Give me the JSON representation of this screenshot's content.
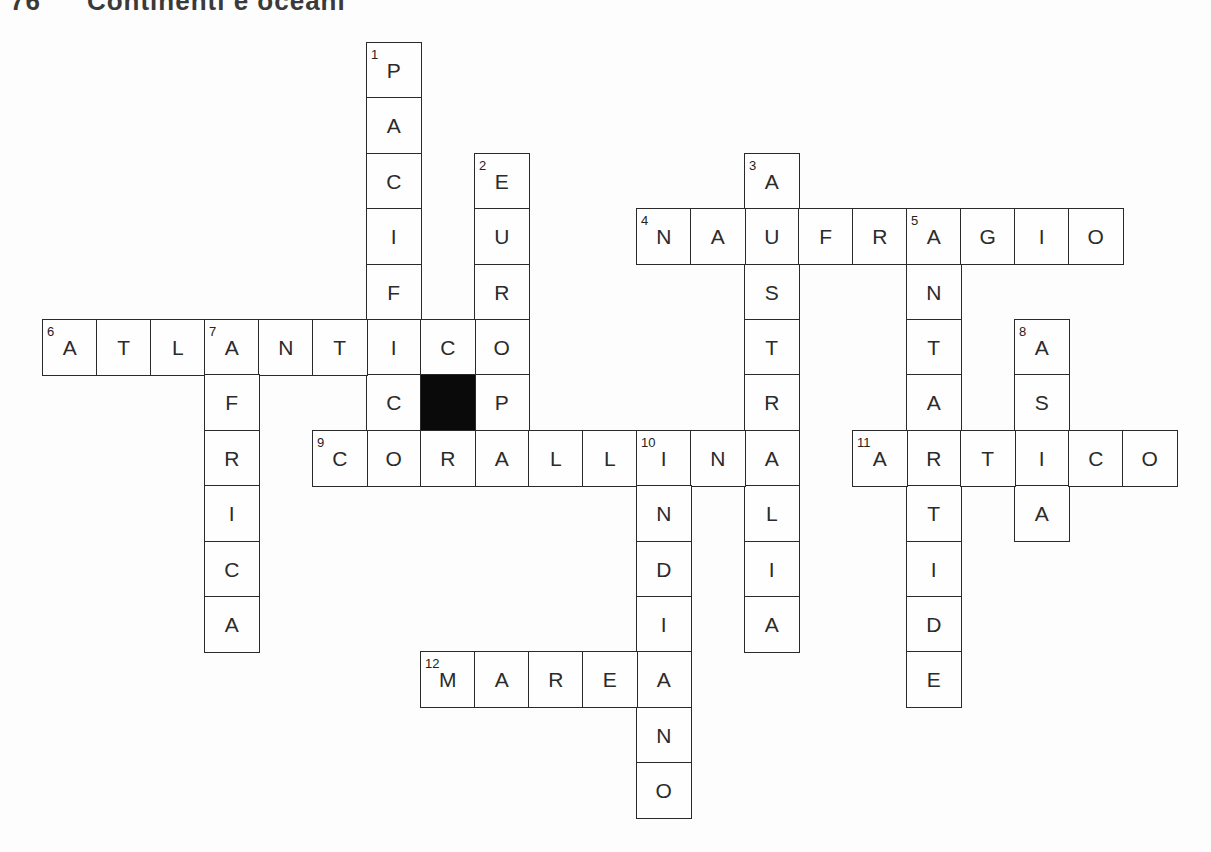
{
  "title": {
    "number": "76",
    "text": "Continenti e oceani"
  },
  "crossword": {
    "grid_origin": {
      "x": 42,
      "y": 42
    },
    "cell_width": 54,
    "cell_height": 55.4,
    "black_cells": [
      {
        "col": 7,
        "row": 6
      }
    ],
    "words": [
      {
        "number": 1,
        "direction": "down",
        "answer": "PACIFICO",
        "col": 6,
        "row": 0
      },
      {
        "number": 2,
        "direction": "down",
        "answer": "EUROPA",
        "col": 8,
        "row": 2
      },
      {
        "number": 3,
        "direction": "down",
        "answer": "AUSTRALIA",
        "col": 13,
        "row": 2
      },
      {
        "number": 4,
        "direction": "across",
        "answer": "NAUFRAGIO",
        "col": 11,
        "row": 3
      },
      {
        "number": 5,
        "direction": "down",
        "answer": "ANTARTIDE",
        "col": 16,
        "row": 3
      },
      {
        "number": 6,
        "direction": "across",
        "answer": "ATLANTICO",
        "col": 0,
        "row": 5
      },
      {
        "number": 7,
        "direction": "down",
        "answer": "AFRICA",
        "col": 3,
        "row": 5
      },
      {
        "number": 8,
        "direction": "down",
        "answer": "ASIA",
        "col": 18,
        "row": 5
      },
      {
        "number": 9,
        "direction": "across",
        "answer": "CORALLINA",
        "col": 5,
        "row": 7
      },
      {
        "number": 10,
        "direction": "down",
        "answer": "INDIANO",
        "col": 11,
        "row": 7
      },
      {
        "number": 11,
        "direction": "across",
        "answer": "ARTICO",
        "col": 15,
        "row": 7
      },
      {
        "number": 12,
        "direction": "across",
        "answer": "MAREA",
        "col": 7,
        "row": 11
      }
    ]
  }
}
